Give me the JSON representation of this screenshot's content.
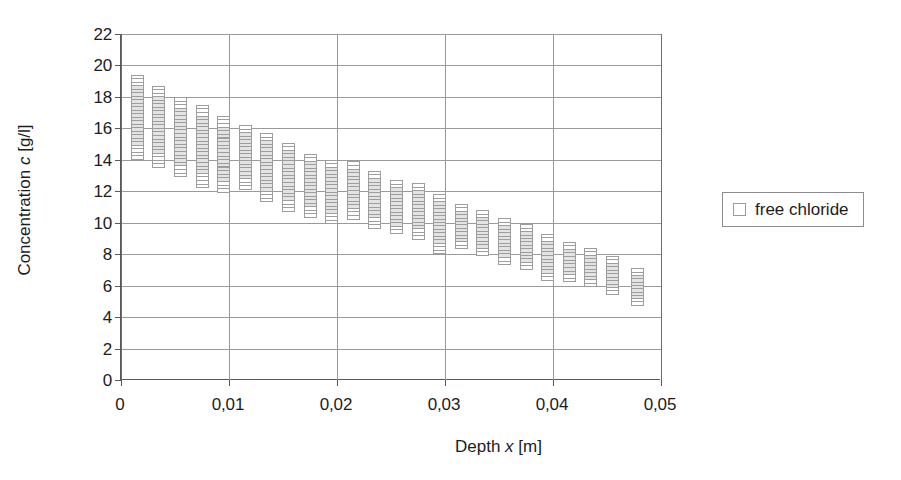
{
  "chart_data": {
    "type": "scatter",
    "title": "",
    "xlabel": "Depth x [m]",
    "ylabel": "Concentration c [g/l]",
    "xlim": [
      0,
      0.05
    ],
    "ylim": [
      0,
      22
    ],
    "xticks": [
      "0",
      "0,01",
      "0,02",
      "0,03",
      "0,04",
      "0,05"
    ],
    "xtick_values": [
      0,
      0.01,
      0.02,
      0.03,
      0.04,
      0.05
    ],
    "yticks": [
      "0",
      "2",
      "4",
      "6",
      "8",
      "10",
      "12",
      "14",
      "16",
      "18",
      "20",
      "22"
    ],
    "ytick_values": [
      0,
      2,
      4,
      6,
      8,
      10,
      12,
      14,
      16,
      18,
      20,
      22
    ],
    "grid": true,
    "legend_position": "right",
    "legend": [
      "free chloride"
    ],
    "series": [
      {
        "name": "free chloride",
        "marker": "open-square",
        "description": "Vertical stacks of repeated open-square measurements at each depth; each column spans the measured concentration range.",
        "columns": [
          {
            "x": 0.0015,
            "y_min": 14.0,
            "y_max": 19.4
          },
          {
            "x": 0.0035,
            "y_min": 13.5,
            "y_max": 18.7
          },
          {
            "x": 0.0055,
            "y_min": 12.9,
            "y_max": 18.0
          },
          {
            "x": 0.0075,
            "y_min": 12.2,
            "y_max": 17.5
          },
          {
            "x": 0.0095,
            "y_min": 11.9,
            "y_max": 16.8
          },
          {
            "x": 0.0115,
            "y_min": 12.1,
            "y_max": 16.2
          },
          {
            "x": 0.0135,
            "y_min": 11.3,
            "y_max": 15.7
          },
          {
            "x": 0.0155,
            "y_min": 10.7,
            "y_max": 15.1
          },
          {
            "x": 0.0175,
            "y_min": 10.3,
            "y_max": 14.4
          },
          {
            "x": 0.0195,
            "y_min": 9.9,
            "y_max": 14.0
          },
          {
            "x": 0.0215,
            "y_min": 10.2,
            "y_max": 13.9
          },
          {
            "x": 0.0235,
            "y_min": 9.6,
            "y_max": 13.3
          },
          {
            "x": 0.0255,
            "y_min": 9.3,
            "y_max": 12.7
          },
          {
            "x": 0.0275,
            "y_min": 8.9,
            "y_max": 12.5
          },
          {
            "x": 0.0295,
            "y_min": 8.0,
            "y_max": 11.8
          },
          {
            "x": 0.0315,
            "y_min": 8.3,
            "y_max": 11.2
          },
          {
            "x": 0.0335,
            "y_min": 7.9,
            "y_max": 10.8
          },
          {
            "x": 0.0355,
            "y_min": 7.3,
            "y_max": 10.3
          },
          {
            "x": 0.0375,
            "y_min": 7.0,
            "y_max": 9.9
          },
          {
            "x": 0.0395,
            "y_min": 6.3,
            "y_max": 9.3
          },
          {
            "x": 0.0415,
            "y_min": 6.2,
            "y_max": 8.8
          },
          {
            "x": 0.0435,
            "y_min": 5.9,
            "y_max": 8.4
          },
          {
            "x": 0.0455,
            "y_min": 5.4,
            "y_max": 7.9
          },
          {
            "x": 0.0478,
            "y_min": 4.7,
            "y_max": 7.1
          }
        ]
      }
    ]
  },
  "legend": {
    "entry_label": "free chloride",
    "swatch": "open-square-marker"
  },
  "axes": {
    "y_title_prefix": "Concentration ",
    "y_title_italic": "c",
    "y_title_suffix": " [g/l]",
    "x_title_prefix": "Depth ",
    "x_title_italic": "x",
    "x_title_suffix": " [m]"
  },
  "colors": {
    "axis": "#59595b",
    "grid": "#9a9a9c",
    "marker_border": "#9d9d9f",
    "marker_fill": "#ffffff",
    "text": "#1c1c1c",
    "background": "#ffffff"
  }
}
